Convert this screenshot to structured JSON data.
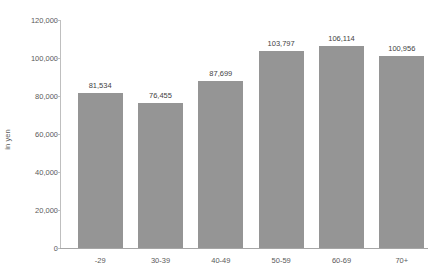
{
  "chart_data": {
    "type": "bar",
    "title": "",
    "xlabel": "",
    "ylabel": "in yen",
    "categories": [
      "-29",
      "30-39",
      "40-49",
      "50-59",
      "60-69",
      "70+"
    ],
    "values": [
      81534,
      76455,
      87699,
      103797,
      106114,
      100956
    ],
    "value_labels": [
      "81,534",
      "76,455",
      "87,699",
      "103,797",
      "106,114",
      "100,956"
    ],
    "ylim": [
      0,
      120000
    ],
    "ytick_values": [
      0,
      20000,
      40000,
      60000,
      80000,
      100000,
      120000
    ],
    "ytick_labels": [
      "0",
      "20,000",
      "40,000",
      "60,000",
      "80,000",
      "100,000",
      "120,000"
    ],
    "grid": false,
    "legend": false,
    "legend_position": "none",
    "bar_color": "#959595",
    "axis_color": "#bfbfbf",
    "baseline_color": "#a6a6a6",
    "label_color": "#3f3f3f",
    "tick_color": "#5a5a5a",
    "background": "#ffffff"
  }
}
